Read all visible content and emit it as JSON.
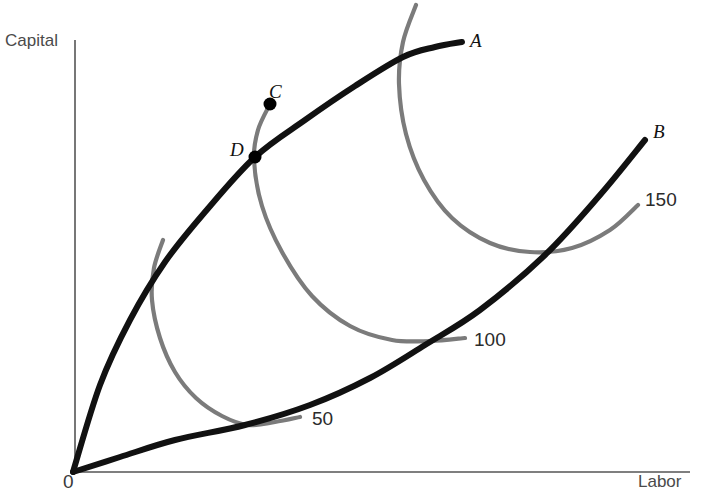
{
  "figure": {
    "kind": "isoquant-expansion-path-diagram",
    "background_color": "#ffffff",
    "axes": {
      "y_axis_label": "Capital",
      "x_axis_label": "Labor",
      "origin_label": "0",
      "axis_color": "#555555"
    },
    "path_color": "#111111",
    "isoquant_color": "#7b7b7b",
    "point_color": "#000000"
  },
  "paths": [
    {
      "id": "A",
      "label": "A",
      "kind": "expansion-path-capital-intensive"
    },
    {
      "id": "B",
      "label": "B",
      "kind": "expansion-path-labor-intensive"
    }
  ],
  "points": [
    {
      "id": "C",
      "label": "C"
    },
    {
      "id": "D",
      "label": "D"
    }
  ],
  "isoquants": [
    {
      "id": "q50",
      "label": "50"
    },
    {
      "id": "q100",
      "label": "100"
    },
    {
      "id": "q150",
      "label": "150"
    }
  ],
  "chart_data": {
    "type": "line",
    "title": "",
    "xlabel": "Labor",
    "ylabel": "Capital",
    "grid": false,
    "legend": "none",
    "xlim": [
      0,
      706
    ],
    "ylim": [
      0,
      504
    ],
    "annotations": [
      {
        "text": "A",
        "x": 475,
        "y": 44
      },
      {
        "text": "B",
        "x": 660,
        "y": 135
      },
      {
        "text": "C",
        "x": 277,
        "y": 93
      },
      {
        "text": "D",
        "x": 240,
        "y": 152
      },
      {
        "text": "50",
        "x": 313,
        "y": 420
      },
      {
        "text": "100",
        "x": 478,
        "y": 340
      },
      {
        "text": "150",
        "x": 651,
        "y": 200
      },
      {
        "text": "0",
        "x": 70,
        "y": 484
      },
      {
        "text": "Capital",
        "x": 36,
        "y": 42
      },
      {
        "text": "Labor",
        "x": 665,
        "y": 481
      }
    ],
    "series": [
      {
        "name": "A",
        "role": "expansion path (capital-intensive)",
        "color": "#111111",
        "x": [
          73,
          100,
          130,
          165,
          205,
          255,
          305,
          355,
          403,
          435,
          462
        ],
        "y": [
          472,
          385,
          320,
          262,
          212,
          157,
          120,
          86,
          57,
          47,
          42
        ]
      },
      {
        "name": "B",
        "role": "expansion path (labor-intensive)",
        "color": "#111111",
        "x": [
          73,
          120,
          175,
          245,
          310,
          370,
          425,
          480,
          545,
          600,
          645
        ],
        "y": [
          472,
          457,
          440,
          425,
          405,
          378,
          345,
          310,
          255,
          195,
          140
        ]
      },
      {
        "name": "50",
        "role": "isoquant",
        "color": "#7b7b7b",
        "x": [
          163,
          154,
          152,
          160,
          175,
          196,
          222,
          248,
          275,
          300
        ],
        "y": [
          240,
          268,
          300,
          338,
          372,
          398,
          416,
          425,
          422,
          417
        ]
      },
      {
        "name": "100",
        "role": "isoquant",
        "color": "#7b7b7b",
        "x": [
          270,
          258,
          254,
          262,
          282,
          312,
          350,
          392,
          430,
          465
        ],
        "y": [
          104,
          130,
          160,
          206,
          252,
          296,
          326,
          340,
          341,
          338
        ]
      },
      {
        "name": "150",
        "role": "isoquant",
        "color": "#7b7b7b",
        "x": [
          416,
          403,
          399,
          406,
          424,
          452,
          490,
          530,
          572,
          610,
          638
        ],
        "y": [
          5,
          42,
          84,
          134,
          180,
          218,
          243,
          252,
          248,
          230,
          205
        ]
      }
    ],
    "points": [
      {
        "name": "C",
        "x": 270,
        "y": 104
      },
      {
        "name": "D",
        "x": 255,
        "y": 157
      }
    ]
  }
}
